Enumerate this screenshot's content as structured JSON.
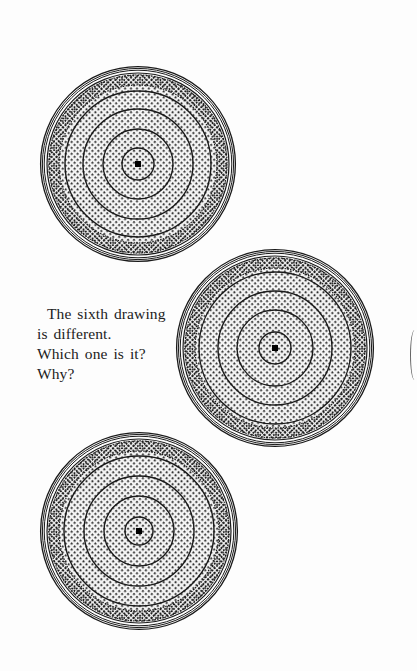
{
  "page": {
    "background": "#fdfdfd",
    "ink_color": "#1a1a1a"
  },
  "caption": {
    "lines": [
      "The sixth drawing",
      "is different.",
      "Which one is it?",
      "Why?"
    ]
  },
  "drawings": [
    {
      "id": "drawing-1",
      "shape": "concentric-circles-with-dot-texture",
      "cx": 138,
      "cy": 164,
      "r": 98,
      "outer_rings": 4,
      "inner_circles": [
        16,
        35,
        55,
        73
      ],
      "center_dot": true
    },
    {
      "id": "drawing-2",
      "shape": "concentric-circles-with-dot-texture",
      "cx": 275,
      "cy": 348,
      "r": 99,
      "outer_rings": 4,
      "inner_circles": [
        16,
        38,
        57,
        76
      ],
      "center_dot": true
    },
    {
      "id": "drawing-3",
      "shape": "concentric-circles-with-dot-texture",
      "cx": 139,
      "cy": 531,
      "r": 99,
      "outer_rings": 4,
      "inner_circles": [
        14,
        35,
        55,
        75
      ],
      "center_dot": true
    }
  ],
  "edge_artifacts": [
    {
      "id": "right-edge-arc",
      "x": 414,
      "y_start": 330,
      "y_end": 380
    }
  ]
}
